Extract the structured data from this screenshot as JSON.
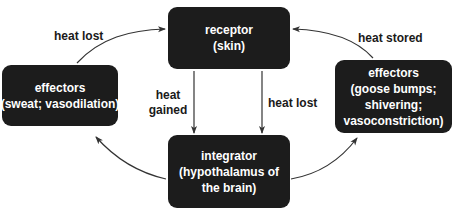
{
  "diagram": {
    "colors": {
      "box_fill": "#1c1c1c",
      "box_text": "#ffffff",
      "arrow": "#333333",
      "label_text": "#1a1a1a",
      "background": "#ffffff"
    },
    "nodes": {
      "receptor": {
        "lines": [
          "receptor",
          "(skin)"
        ]
      },
      "integrator": {
        "lines": [
          "integrator",
          "(hypothalamus of",
          "the brain)"
        ]
      },
      "effectors_cooling": {
        "lines": [
          "effectors",
          "(sweat; vasodilation)"
        ]
      },
      "effectors_warming": {
        "lines": [
          "effectors",
          "(goose bumps;",
          "shivering;",
          "vasoconstriction)"
        ]
      }
    },
    "edge_labels": {
      "top_left": "heat lost",
      "top_right": "heat stored",
      "center_left": [
        "heat",
        "gained"
      ],
      "center_right": "heat lost"
    },
    "edges": [
      {
        "from": "effectors_cooling",
        "to": "receptor",
        "label": "heat lost"
      },
      {
        "from": "effectors_warming",
        "to": "receptor",
        "label": "heat stored"
      },
      {
        "from": "receptor",
        "to": "integrator",
        "label": "heat gained"
      },
      {
        "from": "receptor",
        "to": "integrator",
        "label": "heat lost"
      },
      {
        "from": "integrator",
        "to": "effectors_cooling",
        "label": ""
      },
      {
        "from": "integrator",
        "to": "effectors_warming",
        "label": ""
      }
    ]
  }
}
